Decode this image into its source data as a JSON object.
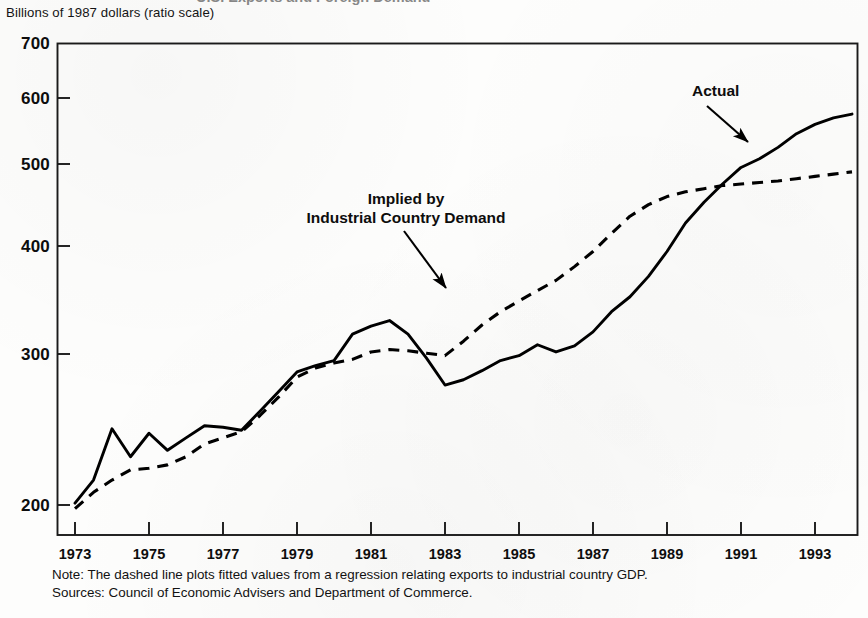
{
  "figure": {
    "title_partial": "U.S. Exports and Foreign Demand",
    "axis_units_label": "Billions of 1987 dollars (ratio scale)"
  },
  "annotations": {
    "actual": "Actual",
    "implied_line1": "Implied by",
    "implied_line2": "Industrial Country Demand"
  },
  "footnotes": {
    "note": "Note: The dashed line plots fitted values from a regression relating exports to industrial country GDP.",
    "sources": "Sources: Council of Economic Advisers and Department of Commerce."
  },
  "chart_data": {
    "type": "line",
    "title": "U.S. Exports and Foreign Demand",
    "xlabel": "",
    "ylabel": "Billions of 1987 dollars (ratio scale)",
    "yscale": "log",
    "ylim": [
      190,
      700
    ],
    "xlim": [
      1973,
      1994
    ],
    "grid": false,
    "legend_position": "inline-annotations",
    "ytick_labels": [
      "700",
      "600",
      "500",
      "400",
      "300",
      "200"
    ],
    "ytick_values": [
      700,
      600,
      500,
      400,
      300,
      200
    ],
    "xtick_labels": [
      "1973",
      "1975",
      "1977",
      "1979",
      "1981",
      "1983",
      "1985",
      "1987",
      "1989",
      "1991",
      "1993"
    ],
    "xtick_values": [
      1973,
      1975,
      1977,
      1979,
      1981,
      1983,
      1985,
      1987,
      1989,
      1991,
      1993
    ],
    "x": [
      1973.0,
      1973.5,
      1974.0,
      1974.5,
      1975.0,
      1975.5,
      1976.0,
      1976.5,
      1977.0,
      1977.5,
      1978.0,
      1978.5,
      1979.0,
      1979.5,
      1980.0,
      1980.5,
      1981.0,
      1981.5,
      1982.0,
      1982.5,
      1983.0,
      1983.5,
      1984.0,
      1984.5,
      1985.0,
      1985.5,
      1986.0,
      1986.5,
      1987.0,
      1987.5,
      1988.0,
      1988.5,
      1989.0,
      1989.5,
      1990.0,
      1990.5,
      1991.0,
      1991.5,
      1992.0,
      1992.5,
      1993.0,
      1993.5,
      1994.0
    ],
    "series": [
      {
        "name": "Actual",
        "style": "solid",
        "color": "#000000",
        "values": [
          201,
          214,
          246,
          228,
          243,
          232,
          240,
          248,
          247,
          245,
          258,
          272,
          287,
          292,
          296,
          318,
          325,
          330,
          318,
          298,
          277,
          281,
          288,
          296,
          300,
          309,
          303,
          308,
          320,
          338,
          352,
          372,
          398,
          430,
          455,
          478,
          500,
          512,
          528,
          548,
          562,
          572,
          578
        ]
      },
      {
        "name": "Implied by Industrial Country Demand",
        "style": "dashed",
        "color": "#000000",
        "values": [
          198,
          207,
          214,
          220,
          221,
          223,
          228,
          236,
          240,
          244,
          255,
          268,
          283,
          290,
          294,
          297,
          303,
          305,
          304,
          302,
          300,
          312,
          326,
          338,
          348,
          358,
          368,
          382,
          398,
          418,
          438,
          452,
          462,
          468,
          472,
          476,
          478,
          480,
          482,
          485,
          488,
          491,
          494
        ]
      }
    ]
  }
}
